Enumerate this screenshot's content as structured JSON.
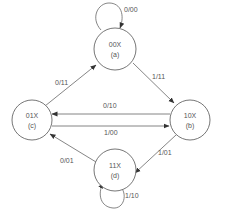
{
  "diagram": {
    "type": "state-machine",
    "colors": {
      "stroke": "#666666",
      "text": "#555555",
      "background": "#ffffff"
    },
    "states": [
      {
        "id": "a",
        "code": "00X",
        "label": "(a)"
      },
      {
        "id": "b",
        "code": "10X",
        "label": "(b)"
      },
      {
        "id": "c",
        "code": "01X",
        "label": "(c)"
      },
      {
        "id": "d",
        "code": "11X",
        "label": "(d)"
      }
    ],
    "transitions": [
      {
        "from": "a",
        "to": "a",
        "label": "0/00"
      },
      {
        "from": "a",
        "to": "b",
        "label": "1/11"
      },
      {
        "from": "c",
        "to": "a",
        "label": "0/11"
      },
      {
        "from": "b",
        "to": "c",
        "label": "0/10"
      },
      {
        "from": "c",
        "to": "b",
        "label": "1/00"
      },
      {
        "from": "b",
        "to": "d",
        "label": "1/01"
      },
      {
        "from": "d",
        "to": "c",
        "label": "0/01"
      },
      {
        "from": "d",
        "to": "d",
        "label": "1/10"
      }
    ]
  }
}
